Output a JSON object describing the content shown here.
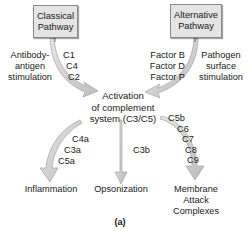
{
  "diagram": {
    "nodes": {
      "classical": {
        "line1": "Classical",
        "line2": "Pathway"
      },
      "alternative": {
        "line1": "Alternative",
        "line2": "Pathway"
      },
      "activation": {
        "line1": "Activation",
        "line2": "of complement",
        "line3": "system (C3/C5)"
      }
    },
    "edges": {
      "classical_trigger": {
        "line1": "Antibody-",
        "line2": "antigen",
        "line3": "stimulation"
      },
      "classical_components": [
        "C1",
        "C4",
        "C2"
      ],
      "alternative_factors": [
        "Factor B",
        "Factor D",
        "Factor P"
      ],
      "alternative_trigger": {
        "line1": "Pathogen",
        "line2": "surface",
        "line3": "stimulation"
      },
      "inflammation_components": [
        "C4a",
        "C3a",
        "C5a"
      ],
      "opsonization_components": [
        "C3b"
      ],
      "mac_components": [
        "C5b",
        "C6",
        "C7",
        "C8",
        "C9"
      ]
    },
    "outcomes": {
      "inflammation": "Inflammation",
      "opsonization": "Opsonization",
      "mac": {
        "line1": "Membrane",
        "line2": "Attack",
        "line3": "Complexes"
      }
    },
    "panel_label": "(a)",
    "colors": {
      "box_fill": "#e4e4e4",
      "box_border": "#8a8a8a",
      "arrow_fill": "#d2d2d2",
      "arrow_stroke": "#9a9a9a"
    }
  }
}
